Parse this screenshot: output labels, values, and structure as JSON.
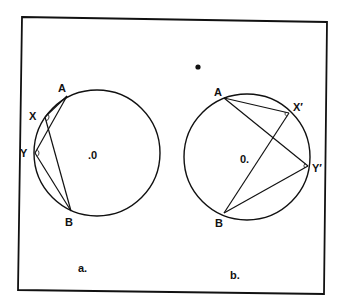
{
  "figure": {
    "frame": {
      "points": "22,17 327,22 324,294 18,290"
    },
    "stray_dot": {
      "cx": 198,
      "cy": 67,
      "r": 2.6
    },
    "panel_a": {
      "caption": "a.",
      "caption_pos": {
        "x": 78,
        "y": 272
      },
      "circle": {
        "cx": 97,
        "cy": 153,
        "r": 63
      },
      "center_label": ".0",
      "center_label_pos": {
        "x": 88,
        "y": 159
      },
      "points": {
        "A": {
          "label": "A",
          "x": 67,
          "y": 96,
          "lx": 58,
          "ly": 92
        },
        "X": {
          "label": "X",
          "x": 45,
          "y": 117,
          "lx": 29,
          "ly": 120
        },
        "Y": {
          "label": "Y",
          "x": 35,
          "y": 153,
          "lx": 20,
          "ly": 157
        },
        "B": {
          "label": "B",
          "x": 71,
          "y": 211,
          "lx": 65,
          "ly": 226
        }
      }
    },
    "panel_b": {
      "caption": "b.",
      "caption_pos": {
        "x": 230,
        "y": 279
      },
      "circle": {
        "cx": 247,
        "cy": 157,
        "r": 63
      },
      "center_label": "0.",
      "center_label_pos": {
        "x": 240,
        "y": 163
      },
      "points": {
        "A": {
          "label": "A",
          "x": 224,
          "y": 98,
          "lx": 214,
          "ly": 96
        },
        "X": {
          "label": "X′",
          "x": 289,
          "y": 113,
          "lx": 293,
          "ly": 111
        },
        "Y": {
          "label": "Y′",
          "x": 308,
          "y": 166,
          "lx": 312,
          "ly": 172
        },
        "B": {
          "label": "B",
          "x": 224,
          "y": 213,
          "lx": 215,
          "ly": 227
        }
      }
    }
  }
}
